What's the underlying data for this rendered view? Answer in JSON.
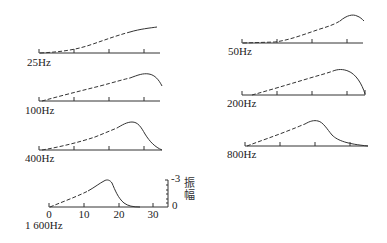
{
  "figure": {
    "axis": {
      "x_unit": "mm (distance from stapes)",
      "tick_values": [
        0,
        10,
        20,
        30
      ],
      "tick_labels_shown_on": "1 600Hz"
    },
    "amplitude_scale": {
      "label": "振幅",
      "label_chars": [
        "振",
        "幅"
      ],
      "top_value": "-3",
      "bottom_value": "0"
    },
    "panels": [
      {
        "id": "25hz",
        "label": "25Hz",
        "column": "left",
        "peak_mm": 33,
        "note": "monotonic rise to apex"
      },
      {
        "id": "50hz",
        "label": "50Hz",
        "column": "right",
        "peak_mm": 30
      },
      {
        "id": "100hz",
        "label": "100Hz",
        "column": "left",
        "peak_mm": 28
      },
      {
        "id": "200hz",
        "label": "200Hz",
        "column": "right",
        "peak_mm": 26
      },
      {
        "id": "400hz",
        "label": "400Hz",
        "column": "left",
        "peak_mm": 24
      },
      {
        "id": "800hz",
        "label": "800Hz",
        "column": "right",
        "peak_mm": 20
      },
      {
        "id": "1600hz",
        "label": "1 600Hz",
        "column": "left",
        "peak_mm": 17
      }
    ],
    "line_styles": {
      "rising_part": "dashed",
      "peak_and_decay": "solid"
    },
    "colors": {
      "line": "#333333",
      "background": "#ffffff"
    }
  }
}
